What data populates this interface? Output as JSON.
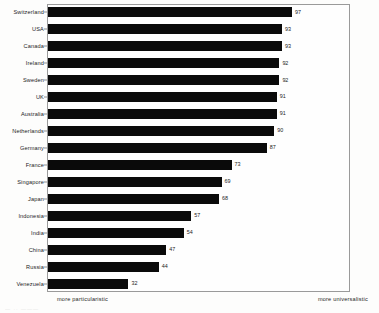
{
  "chart_data": {
    "type": "bar",
    "orientation": "horizontal",
    "title": "",
    "subtitle": "",
    "xlabel": "",
    "ylabel": "",
    "xlim": [
      0,
      100
    ],
    "grid": false,
    "legend": false,
    "value_labels": true,
    "bar_color": "#0a0a0a",
    "categories": [
      "Switzerland",
      "USA",
      "Canada",
      "Ireland",
      "Sweden",
      "UK",
      "Australia",
      "Netherlands",
      "Germany",
      "France",
      "Singapore",
      "Japan",
      "Indonesia",
      "India",
      "China",
      "Russia",
      "Venezuela"
    ],
    "values": [
      97,
      93,
      93,
      92,
      92,
      91,
      91,
      90,
      87,
      73,
      69,
      68,
      57,
      54,
      47,
      44,
      32
    ],
    "annotations": {
      "axis_left_caption": "more particularistic",
      "axis_right_caption": "more universalistic"
    }
  },
  "axis": {
    "left_caption": "more particularistic",
    "right_caption": "more universalistic"
  },
  "artifact": {
    "bottom_text": "—  ··  ———"
  }
}
